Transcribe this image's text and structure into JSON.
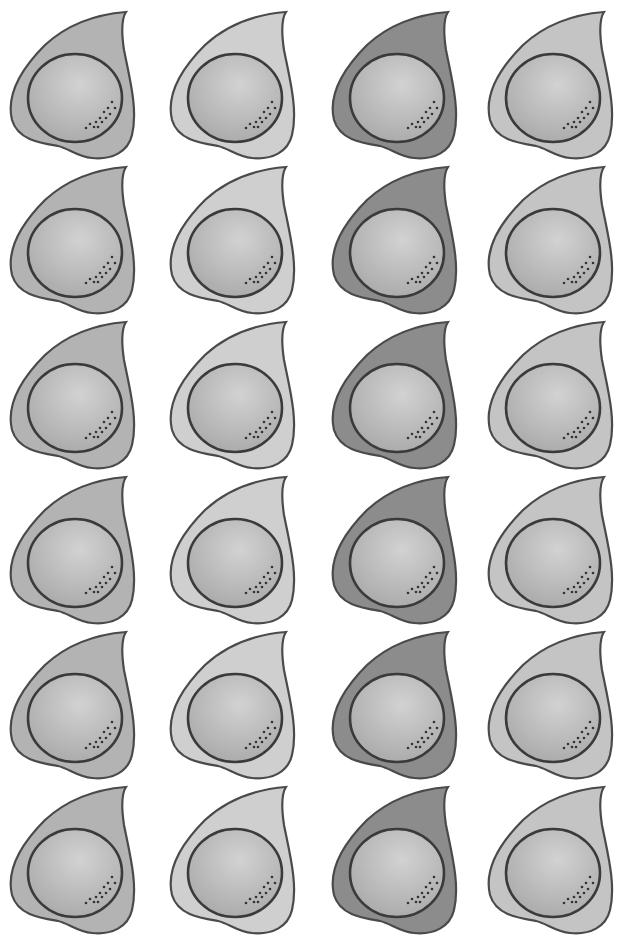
{
  "figure": {
    "columns": 4,
    "rows": 6,
    "column_fills": [
      "#b3b3b3",
      "#cfcfcf",
      "#8c8c8c",
      "#c4c4c4"
    ],
    "nucleus_fill": "#bdbdbd",
    "outline_color": "#3a3a3a"
  },
  "cells": [
    {
      "row": 0,
      "col": 0
    },
    {
      "row": 0,
      "col": 1
    },
    {
      "row": 0,
      "col": 2
    },
    {
      "row": 0,
      "col": 3
    },
    {
      "row": 1,
      "col": 0
    },
    {
      "row": 1,
      "col": 1
    },
    {
      "row": 1,
      "col": 2
    },
    {
      "row": 1,
      "col": 3
    },
    {
      "row": 2,
      "col": 0
    },
    {
      "row": 2,
      "col": 1
    },
    {
      "row": 2,
      "col": 2
    },
    {
      "row": 2,
      "col": 3
    },
    {
      "row": 3,
      "col": 0
    },
    {
      "row": 3,
      "col": 1
    },
    {
      "row": 3,
      "col": 2
    },
    {
      "row": 3,
      "col": 3
    },
    {
      "row": 4,
      "col": 0
    },
    {
      "row": 4,
      "col": 1
    },
    {
      "row": 4,
      "col": 2
    },
    {
      "row": 4,
      "col": 3
    },
    {
      "row": 5,
      "col": 0
    },
    {
      "row": 5,
      "col": 1
    },
    {
      "row": 5,
      "col": 2
    },
    {
      "row": 5,
      "col": 3
    }
  ]
}
